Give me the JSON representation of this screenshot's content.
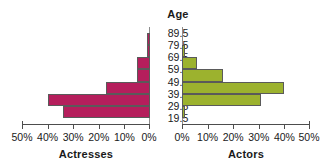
{
  "chart_data": {
    "type": "bar",
    "title": "",
    "subtitle": "",
    "orientation": "horizontal",
    "layout": "population-pyramid",
    "center_axis_title": "Age",
    "categories": [
      "19.5-29.5",
      "29.5-39.5",
      "39.5-49.5",
      "49.5-59.5",
      "59.5-69.5",
      "69.5-79.5",
      "79.5-89.5"
    ],
    "age_tick_labels": [
      "89.5",
      "79.5",
      "69.5",
      "59.5",
      "49.5",
      "39.5",
      "29.5",
      "19.5"
    ],
    "series": [
      {
        "name": "Actresses",
        "side": "left",
        "color": "#b51e5c",
        "values": [
          34,
          40,
          17,
          5,
          5,
          1,
          1
        ],
        "xlabel": "Actresses",
        "tick_labels": [
          "50%",
          "40%",
          "30%",
          "20%",
          "10%",
          "0%"
        ],
        "ticks": [
          50,
          40,
          30,
          20,
          10,
          0
        ],
        "xlim": [
          0,
          50
        ]
      },
      {
        "name": "Actors",
        "side": "right",
        "color": "#9cb22e",
        "values": [
          1,
          31,
          40,
          16,
          6,
          1,
          0
        ],
        "xlabel": "Actors",
        "tick_labels": [
          "0%",
          "10%",
          "20%",
          "30%",
          "40%",
          "50%"
        ],
        "ticks": [
          0,
          10,
          20,
          30,
          40,
          50
        ],
        "xlim": [
          0,
          50
        ]
      }
    ],
    "ylabel": "Age",
    "xlabel": "Percent",
    "grid": false,
    "legend": "none",
    "bar_border_color": "#5a5a5a",
    "axis_color": "#4d4d4d",
    "background": "#ffffff"
  }
}
